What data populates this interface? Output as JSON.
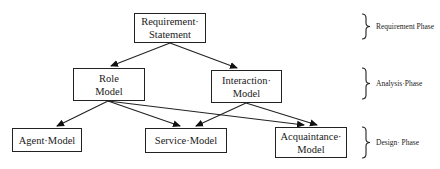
{
  "diagram": {
    "nodes": [
      {
        "id": "requirement-statement",
        "lines": [
          "Requirement·",
          "Statement"
        ]
      },
      {
        "id": "role-model",
        "lines": [
          "Role",
          "Model"
        ]
      },
      {
        "id": "interaction-model",
        "lines": [
          "Interaction·",
          "Model"
        ]
      },
      {
        "id": "agent-model",
        "lines": [
          "Agent·Model"
        ]
      },
      {
        "id": "service-model",
        "lines": [
          "Service·Model"
        ]
      },
      {
        "id": "acquaintance-model",
        "lines": [
          "Acquaintance·",
          "Model"
        ]
      }
    ],
    "edges": [
      {
        "from": "requirement-statement",
        "to": "role-model"
      },
      {
        "from": "requirement-statement",
        "to": "interaction-model"
      },
      {
        "from": "role-model",
        "to": "agent-model"
      },
      {
        "from": "role-model",
        "to": "service-model"
      },
      {
        "from": "role-model",
        "to": "acquaintance-model"
      },
      {
        "from": "interaction-model",
        "to": "service-model"
      },
      {
        "from": "interaction-model",
        "to": "acquaintance-model"
      }
    ],
    "phases": [
      {
        "label": "Requirement Phase"
      },
      {
        "label": "Analysis·Phase"
      },
      {
        "label": "Design· Phase"
      }
    ]
  }
}
